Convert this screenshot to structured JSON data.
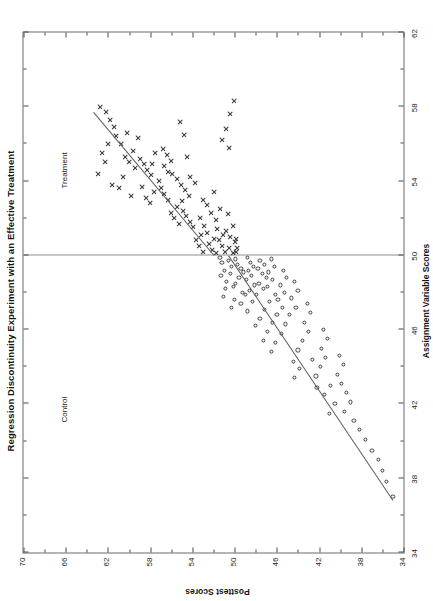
{
  "figure": {
    "title": "Regression Discontinuity Experiment with an Effective Treatment",
    "xaxis_title": "Assignment Variable Scores",
    "yaxis_title": "Posttest Scores",
    "group_label_control": "Control",
    "group_label_treatment": "Treatment"
  },
  "chart_data": {
    "type": "scatter",
    "title": "Regression Discontinuity Experiment with an Effective Treatment",
    "xlabel": "Assignment Variable Scores",
    "ylabel": "Posttest Scores",
    "xlim": [
      34,
      62
    ],
    "ylim": [
      34,
      70
    ],
    "xticks": [
      34,
      38,
      42,
      46,
      50,
      54,
      58,
      62
    ],
    "xtick_labels": [
      "34",
      "38",
      "42",
      "46",
      "50",
      "54",
      "58",
      "62"
    ],
    "yticks": [
      34,
      38,
      42,
      46,
      50,
      54,
      58,
      62,
      66,
      70
    ],
    "ytick_labels": [
      "34",
      "38",
      "42",
      "46",
      "50",
      "54",
      "58",
      "62",
      "66",
      "70"
    ],
    "grid": false,
    "legend_position": "none",
    "cutoff": {
      "x": 50,
      "label": "assignment cutoff"
    },
    "annotations": [
      {
        "text": "Control",
        "x": 41.0,
        "y": 66.6
      },
      {
        "text": "Treatment",
        "x": 53.6,
        "y": 66.6
      }
    ],
    "series": [
      {
        "name": "Control",
        "marker": "circle",
        "note": "Assignment variable scores below the cutoff of 50",
        "points": [
          [
            49.9,
            51.4
          ],
          [
            49.6,
            51.2
          ],
          [
            49.2,
            51.0
          ],
          [
            48.9,
            51.3
          ],
          [
            49.7,
            50.6
          ],
          [
            49.4,
            50.3
          ],
          [
            49.0,
            50.4
          ],
          [
            48.6,
            50.8
          ],
          [
            48.2,
            50.9
          ],
          [
            47.8,
            51.1
          ],
          [
            49.8,
            49.9
          ],
          [
            49.5,
            49.7
          ],
          [
            49.3,
            49.4
          ],
          [
            49.1,
            49.2
          ],
          [
            48.8,
            49.6
          ],
          [
            48.5,
            49.9
          ],
          [
            48.3,
            50.1
          ],
          [
            48.0,
            49.3
          ],
          [
            47.6,
            50.0
          ],
          [
            47.2,
            50.3
          ],
          [
            49.9,
            48.8
          ],
          [
            49.6,
            48.5
          ],
          [
            49.4,
            48.2
          ],
          [
            49.2,
            48.7
          ],
          [
            48.9,
            48.4
          ],
          [
            48.7,
            48.9
          ],
          [
            48.4,
            48.1
          ],
          [
            48.1,
            48.6
          ],
          [
            47.9,
            49.0
          ],
          [
            47.4,
            49.4
          ],
          [
            49.7,
            47.6
          ],
          [
            49.5,
            47.2
          ],
          [
            49.3,
            47.8
          ],
          [
            49.0,
            47.4
          ],
          [
            48.8,
            47.0
          ],
          [
            48.5,
            47.7
          ],
          [
            48.2,
            47.3
          ],
          [
            47.9,
            47.9
          ],
          [
            47.5,
            48.3
          ],
          [
            47.0,
            48.8
          ],
          [
            49.8,
            46.5
          ],
          [
            49.4,
            46.2
          ],
          [
            49.1,
            46.8
          ],
          [
            48.7,
            46.4
          ],
          [
            48.3,
            46.9
          ],
          [
            47.9,
            46.1
          ],
          [
            47.5,
            46.7
          ],
          [
            47.1,
            47.2
          ],
          [
            46.6,
            47.6
          ],
          [
            46.2,
            48.0
          ],
          [
            49.2,
            45.4
          ],
          [
            48.8,
            45.1
          ],
          [
            48.4,
            45.7
          ],
          [
            48.0,
            45.3
          ],
          [
            47.6,
            45.9
          ],
          [
            47.2,
            45.5
          ],
          [
            46.8,
            46.0
          ],
          [
            46.4,
            46.4
          ],
          [
            45.9,
            46.9
          ],
          [
            45.4,
            47.3
          ],
          [
            48.6,
            44.3
          ],
          [
            48.1,
            44.0
          ],
          [
            47.7,
            44.6
          ],
          [
            47.2,
            44.2
          ],
          [
            46.8,
            44.8
          ],
          [
            46.3,
            45.2
          ],
          [
            45.8,
            45.6
          ],
          [
            45.3,
            46.1
          ],
          [
            44.8,
            46.5
          ],
          [
            44.3,
            44.4
          ],
          [
            47.4,
            43.1
          ],
          [
            46.9,
            42.8
          ],
          [
            46.4,
            43.4
          ],
          [
            45.9,
            43.0
          ],
          [
            45.4,
            43.6
          ],
          [
            44.9,
            44.0
          ],
          [
            44.4,
            42.6
          ],
          [
            43.9,
            43.9
          ],
          [
            43.4,
            44.3
          ],
          [
            42.9,
            42.2
          ],
          [
            46.0,
            41.6
          ],
          [
            45.5,
            41.2
          ],
          [
            45.0,
            41.8
          ],
          [
            44.5,
            41.4
          ],
          [
            44.0,
            41.9
          ],
          [
            43.5,
            42.3
          ],
          [
            43.0,
            40.9
          ],
          [
            42.5,
            41.5
          ],
          [
            42.0,
            40.5
          ],
          [
            41.5,
            41.0
          ],
          [
            44.6,
            40.1
          ],
          [
            44.1,
            39.7
          ],
          [
            43.6,
            40.3
          ],
          [
            43.1,
            39.9
          ],
          [
            42.6,
            39.4
          ],
          [
            42.1,
            39.0
          ],
          [
            41.6,
            39.6
          ],
          [
            41.1,
            38.7
          ],
          [
            40.6,
            38.2
          ],
          [
            40.1,
            37.6
          ],
          [
            39.5,
            37.0
          ],
          [
            39.0,
            36.4
          ],
          [
            38.4,
            36.0
          ],
          [
            37.8,
            35.6
          ],
          [
            37.0,
            35.0
          ]
        ]
      },
      {
        "name": "Treatment",
        "marker": "x",
        "note": "Assignment variable scores at or above the cutoff of 50",
        "points": [
          [
            50.1,
            51.8
          ],
          [
            50.3,
            52.1
          ],
          [
            50.6,
            52.4
          ],
          [
            50.9,
            52.0
          ],
          [
            51.2,
            52.6
          ],
          [
            50.2,
            50.9
          ],
          [
            50.5,
            51.2
          ],
          [
            50.8,
            51.5
          ],
          [
            51.1,
            51.1
          ],
          [
            51.4,
            51.7
          ],
          [
            50.1,
            50.2
          ],
          [
            50.4,
            50.5
          ],
          [
            50.7,
            50.0
          ],
          [
            51.0,
            50.4
          ],
          [
            51.3,
            50.8
          ],
          [
            50.2,
            53.0
          ],
          [
            50.5,
            53.4
          ],
          [
            50.8,
            53.7
          ],
          [
            51.1,
            53.2
          ],
          [
            51.5,
            53.9
          ],
          [
            51.8,
            54.2
          ],
          [
            52.1,
            54.6
          ],
          [
            52.4,
            54.9
          ],
          [
            51.6,
            52.9
          ],
          [
            52.0,
            53.3
          ],
          [
            51.9,
            51.8
          ],
          [
            52.3,
            52.2
          ],
          [
            52.7,
            52.6
          ],
          [
            53.0,
            53.0
          ],
          [
            52.5,
            51.4
          ],
          [
            51.7,
            55.3
          ],
          [
            52.0,
            55.7
          ],
          [
            52.3,
            56.0
          ],
          [
            52.6,
            55.5
          ],
          [
            53.0,
            56.3
          ],
          [
            53.3,
            56.7
          ],
          [
            53.6,
            57.0
          ],
          [
            52.9,
            55.0
          ],
          [
            53.2,
            54.3
          ],
          [
            53.5,
            54.7
          ],
          [
            53.8,
            55.1
          ],
          [
            54.1,
            55.5
          ],
          [
            54.4,
            55.9
          ],
          [
            53.9,
            53.8
          ],
          [
            54.2,
            54.2
          ],
          [
            52.8,
            58.0
          ],
          [
            53.1,
            58.4
          ],
          [
            53.4,
            57.6
          ],
          [
            53.7,
            58.8
          ],
          [
            54.0,
            57.2
          ],
          [
            54.3,
            57.9
          ],
          [
            54.6,
            58.3
          ],
          [
            54.9,
            58.6
          ],
          [
            55.2,
            59.0
          ],
          [
            55.5,
            57.5
          ],
          [
            54.5,
            56.3
          ],
          [
            54.8,
            56.7
          ],
          [
            55.1,
            56.0
          ],
          [
            55.4,
            56.4
          ],
          [
            55.7,
            56.8
          ],
          [
            55.0,
            60.0
          ],
          [
            55.3,
            60.4
          ],
          [
            55.6,
            59.6
          ],
          [
            56.0,
            60.8
          ],
          [
            56.3,
            59.2
          ],
          [
            56.6,
            60.2
          ],
          [
            54.7,
            59.4
          ],
          [
            54.2,
            60.6
          ],
          [
            53.6,
            61.0
          ],
          [
            53.2,
            59.8
          ],
          [
            56.9,
            61.4
          ],
          [
            57.3,
            61.8
          ],
          [
            57.7,
            62.2
          ],
          [
            56.4,
            61.2
          ],
          [
            56.0,
            62.0
          ],
          [
            55.5,
            62.6
          ],
          [
            55.0,
            62.3
          ],
          [
            54.4,
            62.9
          ],
          [
            53.8,
            61.6
          ],
          [
            58.0,
            62.8
          ],
          [
            54.9,
            57.8
          ],
          [
            55.3,
            54.5
          ],
          [
            56.5,
            54.8
          ],
          [
            57.2,
            55.2
          ],
          [
            53.4,
            52.0
          ],
          [
            52.2,
            50.6
          ],
          [
            51.6,
            50.2
          ],
          [
            50.9,
            49.9
          ],
          [
            50.4,
            49.8
          ],
          [
            50.2,
            49.9
          ],
          [
            58.3,
            50.1
          ],
          [
            57.6,
            50.4
          ],
          [
            56.8,
            50.8
          ],
          [
            56.2,
            51.2
          ],
          [
            55.8,
            50.5
          ]
        ]
      }
    ],
    "fit_lines": [
      {
        "group": "Control",
        "x_from": 36.8,
        "y_from": 35.0,
        "x_to": 50.0,
        "y_to": 50.6
      },
      {
        "group": "Treatment",
        "x_from": 50.0,
        "y_from": 52.0,
        "x_to": 57.7,
        "y_to": 63.4
      }
    ]
  }
}
